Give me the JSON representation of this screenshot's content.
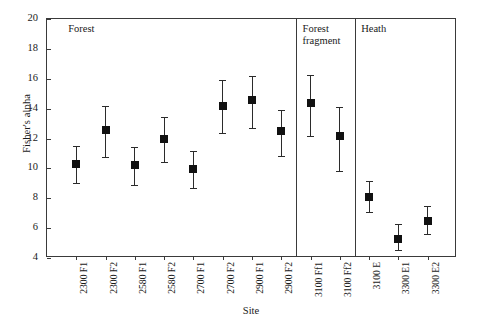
{
  "chart_data": {
    "type": "scatter",
    "title": "",
    "xlabel": "Site",
    "ylabel": "Fisher's alpha",
    "ylim": [
      4,
      20
    ],
    "yticks": [
      4,
      6,
      8,
      10,
      12,
      14,
      16,
      18,
      20
    ],
    "ytick_labels": [
      "4",
      "6",
      "8",
      "10",
      "12",
      "14",
      "16",
      "18",
      "20"
    ],
    "grid": false,
    "legend": "none",
    "error_bars": "vertical, capped",
    "marker": "filled square",
    "categories": [
      "2300 F1",
      "2300 F2",
      "2580 F1",
      "2580 F2",
      "2700 F1",
      "2700 F2",
      "2900 F1",
      "2900 F2",
      "3100 Ff1",
      "3100 Ff2",
      "3100 E",
      "3300 E1",
      "3300 E2"
    ],
    "values": [
      10.3,
      12.55,
      10.25,
      11.95,
      9.95,
      14.15,
      14.6,
      12.5,
      14.35,
      12.15,
      8.1,
      5.3,
      6.5
    ],
    "lower": [
      9.0,
      10.75,
      8.9,
      10.45,
      8.7,
      12.4,
      12.7,
      10.85,
      12.2,
      9.85,
      7.1,
      4.55,
      5.6
    ],
    "upper": [
      11.5,
      14.15,
      11.4,
      13.45,
      11.15,
      15.9,
      16.2,
      13.9,
      16.25,
      14.1,
      9.15,
      6.25,
      7.45
    ],
    "groups": [
      {
        "label": "Forest",
        "start_index": 0,
        "end_index": 7
      },
      {
        "label": "Forest\nfragment",
        "start_index": 8,
        "end_index": 9
      },
      {
        "label": "Heath",
        "start_index": 10,
        "end_index": 12
      }
    ],
    "group_separator_positions": [
      8,
      10
    ],
    "colors": {
      "marker": "#111111",
      "error_bar": "#2b2b2b",
      "axis": "#3a3a3a",
      "text": "#1a1a1a",
      "background": "#ffffff"
    }
  }
}
